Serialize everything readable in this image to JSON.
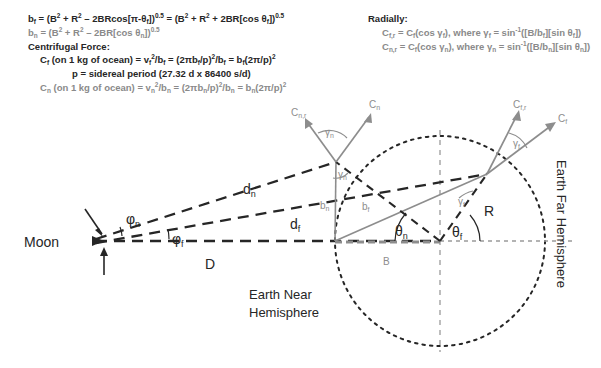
{
  "equations": {
    "left": {
      "line1": "b_f = (B² + R² − 2BRcos[π-θ_f])^0.5 = (B² + R² + 2BR[cos θ_f])^0.5",
      "line2": "b_n = (B² + R² − 2BR[cos θ_n])^0.5",
      "heading": "Centrifugal Force:",
      "line3": "C_f (on 1 kg of ocean) = v_f²/b_f = (2πb_f/p)²/b_f = b_f(2π/p)²",
      "line4": "p = sidereal period (27.32 d x 86400 s/d)",
      "line5": "C_n (on 1 kg of ocean) = v_n²/b_n = (2πb_n/p)²/b_n = b_n(2π/p)²"
    },
    "right": {
      "heading": "Radially:",
      "line1": "C_f,r = C_f(cos γ_f), where γ_f = sin⁻¹([B/b_f][sin θ_f])",
      "line2": "C_n,r = C_f(cos γ_n), where γ_n = sin⁻¹([B/b_n][sin θ_n])"
    }
  },
  "diagram": {
    "moon_label": "Moon",
    "near_hemisphere_line1": "Earth Near",
    "near_hemisphere_line2": "Hemisphere",
    "far_hemisphere": "Earth Far Hemisphere",
    "labels": {
      "phi_n": "φ",
      "phi_n_sub": "n",
      "phi_f": "φ",
      "phi_f_sub": "f",
      "d_n": "d",
      "d_n_sub": "n",
      "d_f": "d",
      "d_f_sub": "f",
      "D": "D",
      "B": "B",
      "R": "R",
      "b_n": "b",
      "b_n_sub": "n",
      "b_f": "b",
      "b_f_sub": "f",
      "theta_n": "θ",
      "theta_n_sub": "n",
      "theta_f": "θ",
      "theta_f_sub": "f",
      "gamma_n_outer": "γ",
      "gamma_n_outer_sub": "n",
      "gamma_n_inner": "γ",
      "gamma_n_inner_sub": "n",
      "gamma_f_outer": "γ",
      "gamma_f_outer_sub": "f",
      "gamma_f_inner": "γ",
      "gamma_f_inner_sub": "f",
      "C_n": "C",
      "C_n_sub": "n",
      "C_nr": "C",
      "C_nr_sub": "n,r",
      "C_f": "C",
      "C_f_sub": "f",
      "C_fr": "C",
      "C_fr_sub": "f,r"
    }
  },
  "colors": {
    "ink": "#262626",
    "gray": "#8d8d8d",
    "background": "#ffffff"
  }
}
